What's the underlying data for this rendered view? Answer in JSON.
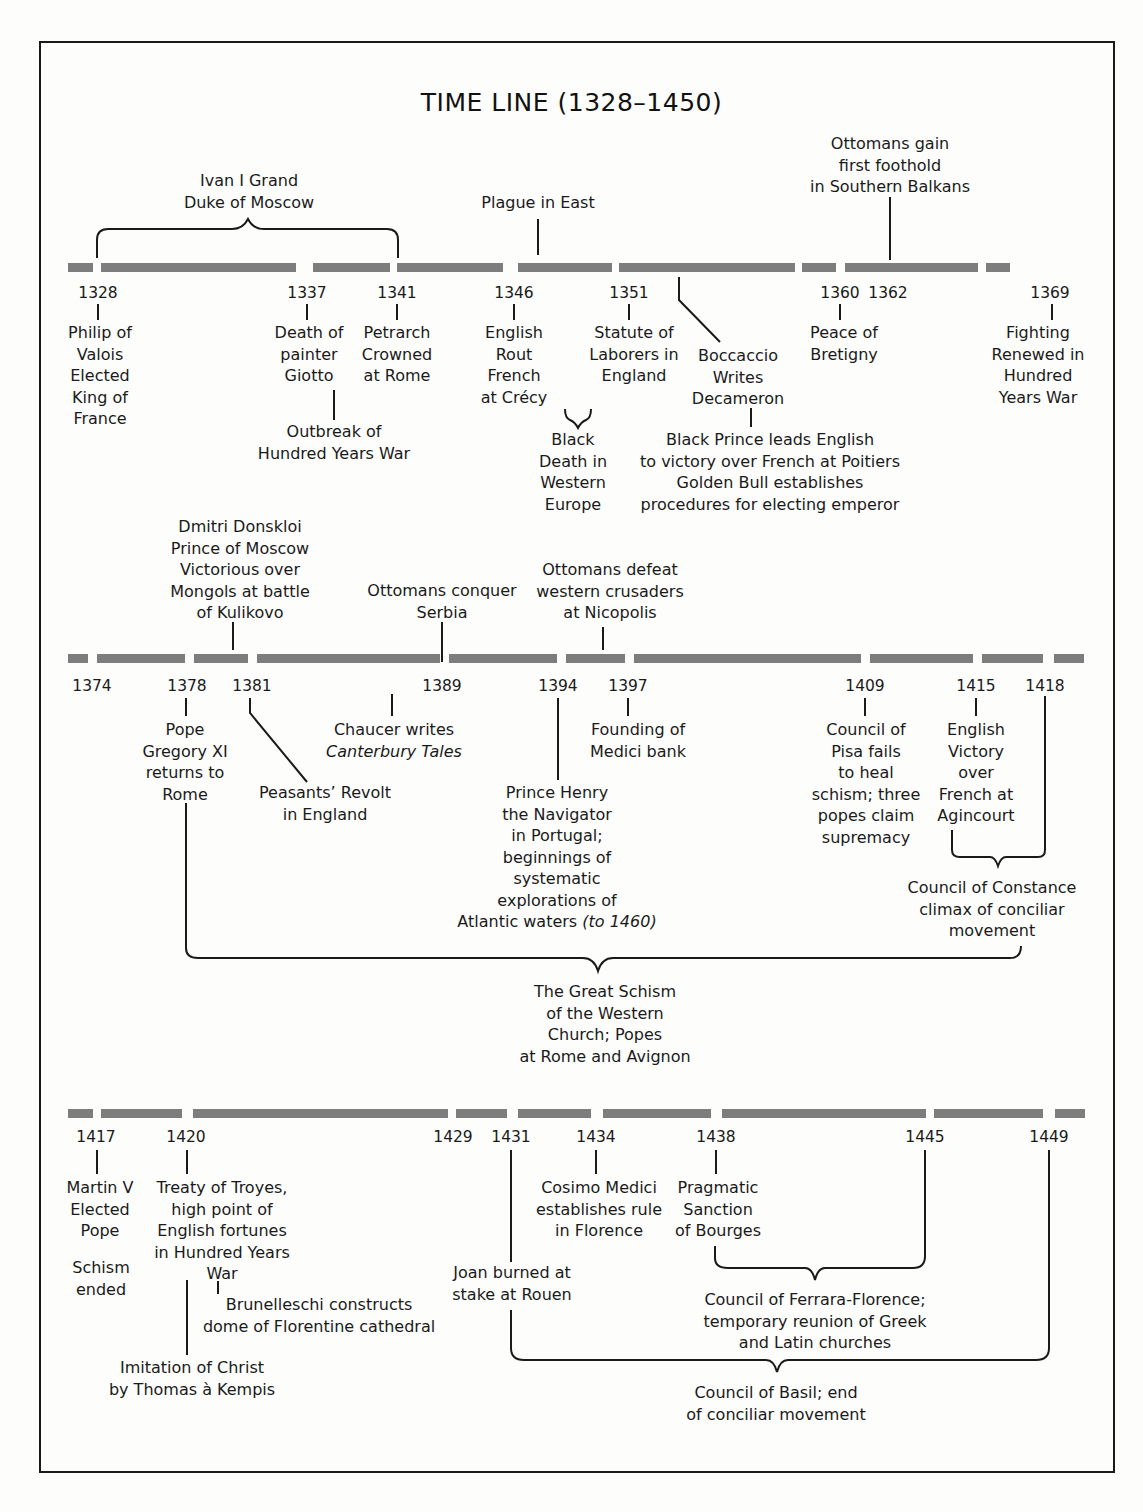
{
  "title": "TIME LINE (1328–1450)",
  "colors": {
    "bar": "#7d7d7d",
    "ink": "#1a1a1a",
    "paper": "#fdfdfc"
  },
  "rows": [
    {
      "id": "row1",
      "years": [
        "1328",
        "1337",
        "1341",
        "1346",
        "1351",
        "1360",
        "1362",
        "1369"
      ],
      "above": [
        {
          "id": "ivan",
          "lines": [
            "Ivan I Grand",
            "Duke of Moscow"
          ]
        },
        {
          "id": "plague_east",
          "lines": [
            "Plague in East"
          ]
        },
        {
          "id": "ottomans_foothold",
          "lines": [
            "Ottomans gain",
            "first foothold",
            "in Southern Balkans"
          ]
        }
      ],
      "below": [
        {
          "id": "philip",
          "year": "1328",
          "lines": [
            "Philip of",
            "Valois",
            "Elected",
            "King of",
            "France"
          ]
        },
        {
          "id": "giotto",
          "year": "1337",
          "lines": [
            "Death of",
            "painter",
            "Giotto"
          ]
        },
        {
          "id": "hundred_years_outbreak",
          "year": "1337",
          "lines": [
            "Outbreak of",
            "Hundred Years War"
          ]
        },
        {
          "id": "petrarch",
          "year": "1341",
          "lines": [
            "Petrarch",
            "Crowned",
            "at Rome"
          ]
        },
        {
          "id": "crecy",
          "year": "1346",
          "lines": [
            "English",
            "Rout",
            "French",
            "at Crécy"
          ]
        },
        {
          "id": "black_death",
          "lines": [
            "Black",
            "Death in",
            "Western",
            "Europe"
          ]
        },
        {
          "id": "statute_laborers",
          "year": "1351",
          "lines": [
            "Statute of",
            "Laborers in",
            "England"
          ]
        },
        {
          "id": "boccaccio",
          "lines": [
            "Boccaccio",
            "Writes",
            "Decameron"
          ]
        },
        {
          "id": "black_prince",
          "lines": [
            "Black Prince leads English",
            "to victory over French at Poitiers",
            "Golden Bull establishes",
            "procedures for electing emperor"
          ]
        },
        {
          "id": "bretigny",
          "year": "1360",
          "lines": [
            "Peace of",
            "Bretigny"
          ]
        },
        {
          "id": "fighting_renewed",
          "year": "1369",
          "lines": [
            "Fighting",
            "Renewed in",
            "Hundred",
            "Years War"
          ]
        }
      ]
    },
    {
      "id": "row2",
      "years": [
        "1374",
        "1378",
        "1381",
        "1389",
        "1394",
        "1397",
        "1409",
        "1415",
        "1418"
      ],
      "above": [
        {
          "id": "dmitri",
          "lines": [
            "Dmitri Donskloi",
            "Prince of Moscow",
            "Victorious over",
            "Mongols at battle",
            "of Kulikovo"
          ]
        },
        {
          "id": "serbia",
          "lines": [
            "Ottomans conquer",
            "Serbia"
          ]
        },
        {
          "id": "nicopolis",
          "lines": [
            "Ottomans defeat",
            "western crusaders",
            "at Nicopolis"
          ]
        }
      ],
      "below": [
        {
          "id": "gregory",
          "year": "1378",
          "lines": [
            "Pope",
            "Gregory XI",
            "returns to",
            "Rome"
          ]
        },
        {
          "id": "peasants_revolt",
          "year": "1381",
          "lines": [
            "Peasants’ Revolt",
            "in England"
          ]
        },
        {
          "id": "chaucer",
          "lines": [
            "Chaucer writes"
          ],
          "italic_line": "Canterbury Tales"
        },
        {
          "id": "prince_henry",
          "year": "1394",
          "lines": [
            "Prince Henry",
            "the Navigator",
            "in Portugal;",
            "beginnings of",
            "systematic",
            "explorations of"
          ],
          "last_line": "Atlantic waters",
          "last_line_italic": "(to 1460)"
        },
        {
          "id": "medici_bank",
          "year": "1397",
          "lines": [
            "Founding of",
            "Medici bank"
          ]
        },
        {
          "id": "pisa",
          "year": "1409",
          "lines": [
            "Council of",
            "Pisa fails",
            "to heal",
            "schism; three",
            "popes claim",
            "supremacy"
          ]
        },
        {
          "id": "agincourt",
          "year": "1415",
          "lines": [
            "English",
            "Victory",
            "over",
            "French at",
            "Agincourt"
          ]
        },
        {
          "id": "constance",
          "lines": [
            "Council of Constance",
            "climax of conciliar",
            "movement"
          ]
        },
        {
          "id": "great_schism",
          "lines": [
            "The Great Schism",
            "of the Western",
            "Church; Popes",
            "at Rome and Avignon"
          ]
        }
      ]
    },
    {
      "id": "row3",
      "years": [
        "1417",
        "1420",
        "1429",
        "1431",
        "1434",
        "1438",
        "1445",
        "1449"
      ],
      "below": [
        {
          "id": "martin_v",
          "year": "1417",
          "lines": [
            "Martin V",
            "Elected",
            "Pope"
          ]
        },
        {
          "id": "schism_ended",
          "lines": [
            "Schism",
            "ended"
          ]
        },
        {
          "id": "troyes",
          "year": "1420",
          "lines": [
            "Treaty of Troyes,",
            "high point of",
            "English fortunes",
            "in Hundred Years",
            "War"
          ]
        },
        {
          "id": "brunelleschi",
          "lines": [
            "Brunelleschi constructs",
            "dome of Florentine cathedral"
          ]
        },
        {
          "id": "imitation",
          "lines": [
            "Imitation of Christ",
            "by Thomas à Kempis"
          ]
        },
        {
          "id": "joan",
          "year": "1431",
          "lines": [
            "Joan burned at",
            "stake at Rouen"
          ]
        },
        {
          "id": "cosimo",
          "year": "1434",
          "lines": [
            "Cosimo Medici",
            "establishes rule",
            "in Florence"
          ]
        },
        {
          "id": "pragmatic",
          "year": "1438",
          "lines": [
            "Pragmatic",
            "Sanction",
            "of Bourges"
          ]
        },
        {
          "id": "ferrara",
          "lines": [
            "Council of Ferrara-Florence;",
            "temporary reunion of Greek",
            "and Latin churches"
          ]
        },
        {
          "id": "basil",
          "lines": [
            "Council of Basil; end",
            "of conciliar  movement"
          ]
        }
      ]
    }
  ]
}
